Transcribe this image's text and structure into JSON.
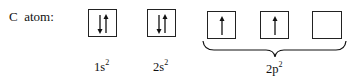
{
  "atom_label": "C  atom:",
  "orbitals": [
    {
      "name": "1s",
      "superscript": "2",
      "electrons": [
        "down",
        "up"
      ]
    },
    {
      "name": "2s",
      "superscript": "2",
      "electrons": [
        "down",
        "up"
      ]
    },
    {
      "name": "2p",
      "superscript": "2",
      "boxes": [
        [
          "up"
        ],
        [
          "up"
        ],
        []
      ]
    }
  ],
  "labels": {
    "s1": "1s",
    "s1_sup": "2",
    "s2": "2s",
    "s2_sup": "2",
    "p": "2p",
    "p_sup": "2"
  }
}
